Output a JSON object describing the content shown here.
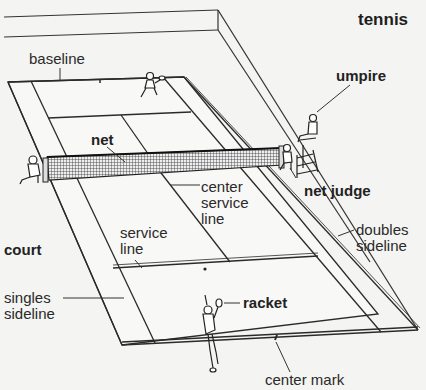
{
  "title": "tennis",
  "colors": {
    "background": "#f4f4f2",
    "line": "#2a2a2a",
    "court_fill": "#f7f7f5"
  },
  "labels": {
    "baseline": "baseline",
    "umpire": "umpire",
    "net": "net",
    "center_service_line": "center\nservice\nline",
    "net_judge": "net judge",
    "service_line": "service\nline",
    "doubles_sideline": "doubles\nsideline",
    "court": "court",
    "singles_sideline": "singles\nsideline",
    "racket": "racket",
    "center_mark": "center mark"
  },
  "figures": [
    {
      "name": "far-player",
      "role": "player"
    },
    {
      "name": "near-player",
      "role": "player serving"
    },
    {
      "name": "umpire",
      "role": "umpire on chair"
    },
    {
      "name": "net-judge-right",
      "role": "net judge"
    },
    {
      "name": "net-judge-left",
      "role": "net judge"
    }
  ]
}
